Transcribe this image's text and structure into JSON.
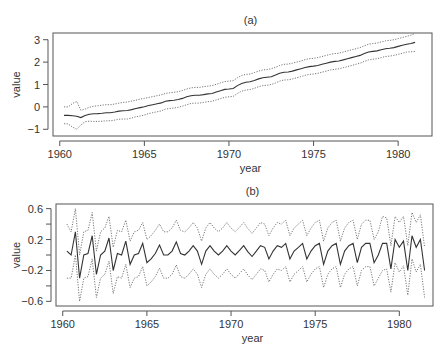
{
  "chart_data": [
    {
      "type": "line",
      "title": "(a)",
      "xlabel": "year",
      "ylabel": "value",
      "xlim": [
        1959.6,
        1982
      ],
      "ylim": [
        -1.3,
        3.3
      ],
      "xticks": [
        1960,
        1965,
        1970,
        1975,
        1980
      ],
      "yticks": [
        -1,
        0,
        1,
        2,
        3
      ],
      "grid": false,
      "legend": "none",
      "box": {
        "left": 53,
        "top": 33,
        "right": 432,
        "bottom": 136
      },
      "x_start": 1960.25,
      "x_step": 0.25,
      "series": [
        {
          "name": "estimate",
          "style": "solid",
          "values": [
            -0.38,
            -0.38,
            -0.4,
            -0.42,
            -0.48,
            -0.38,
            -0.33,
            -0.31,
            -0.3,
            -0.28,
            -0.26,
            -0.26,
            -0.23,
            -0.19,
            -0.17,
            -0.16,
            -0.12,
            -0.07,
            -0.03,
            0.01,
            0.06,
            0.1,
            0.14,
            0.18,
            0.25,
            0.28,
            0.3,
            0.33,
            0.38,
            0.45,
            0.5,
            0.52,
            0.52,
            0.55,
            0.58,
            0.6,
            0.66,
            0.72,
            0.78,
            0.8,
            0.82,
            0.95,
            1.05,
            1.1,
            1.12,
            1.18,
            1.25,
            1.3,
            1.32,
            1.35,
            1.42,
            1.5,
            1.55,
            1.56,
            1.6,
            1.65,
            1.7,
            1.76,
            1.8,
            1.82,
            1.85,
            1.9,
            1.95,
            2.0,
            2.03,
            2.05,
            2.1,
            2.15,
            2.2,
            2.25,
            2.3,
            2.38,
            2.45,
            2.48,
            2.5,
            2.55,
            2.6,
            2.62,
            2.65,
            2.7,
            2.75,
            2.8,
            2.83,
            2.88
          ]
        },
        {
          "name": "upper",
          "style": "dotted",
          "values": [
            0.0,
            0.0,
            0.15,
            0.25,
            -0.15,
            -0.1,
            -0.02,
            0.03,
            0.05,
            0.08,
            0.1,
            0.1,
            0.13,
            0.17,
            0.2,
            0.22,
            0.26,
            0.3,
            0.35,
            0.38,
            0.42,
            0.46,
            0.5,
            0.54,
            0.6,
            0.63,
            0.65,
            0.68,
            0.73,
            0.8,
            0.85,
            0.87,
            0.87,
            0.9,
            0.93,
            0.95,
            1.01,
            1.07,
            1.13,
            1.15,
            1.17,
            1.3,
            1.4,
            1.45,
            1.47,
            1.53,
            1.6,
            1.65,
            1.67,
            1.7,
            1.77,
            1.85,
            1.9,
            1.91,
            1.95,
            2.0,
            2.05,
            2.11,
            2.15,
            2.17,
            2.2,
            2.25,
            2.3,
            2.35,
            2.38,
            2.4,
            2.45,
            2.5,
            2.55,
            2.6,
            2.65,
            2.73,
            2.8,
            2.83,
            2.85,
            2.9,
            2.95,
            2.97,
            3.0,
            3.05,
            3.1,
            3.15,
            3.2,
            3.28
          ]
        },
        {
          "name": "lower",
          "style": "dotted",
          "values": [
            -0.75,
            -0.76,
            -0.9,
            -1.0,
            -0.8,
            -0.66,
            -0.64,
            -0.65,
            -0.65,
            -0.64,
            -0.62,
            -0.62,
            -0.59,
            -0.55,
            -0.54,
            -0.54,
            -0.5,
            -0.44,
            -0.41,
            -0.36,
            -0.3,
            -0.26,
            -0.22,
            -0.18,
            -0.1,
            -0.07,
            -0.05,
            -0.02,
            0.03,
            0.1,
            0.15,
            0.17,
            0.17,
            0.2,
            0.23,
            0.25,
            0.31,
            0.37,
            0.43,
            0.45,
            0.47,
            0.6,
            0.7,
            0.75,
            0.77,
            0.83,
            0.9,
            0.95,
            0.97,
            1.0,
            1.07,
            1.15,
            1.2,
            1.21,
            1.25,
            1.3,
            1.35,
            1.41,
            1.45,
            1.47,
            1.5,
            1.55,
            1.6,
            1.65,
            1.68,
            1.7,
            1.75,
            1.8,
            1.85,
            1.9,
            1.95,
            2.03,
            2.1,
            2.13,
            2.15,
            2.2,
            2.25,
            2.27,
            2.3,
            2.35,
            2.4,
            2.45,
            2.46,
            2.48
          ]
        }
      ]
    },
    {
      "type": "line",
      "title": "(b)",
      "xlabel": "year",
      "ylabel": "value",
      "xlim": [
        1959.6,
        1982
      ],
      "ylim": [
        -0.66,
        0.66
      ],
      "xticks": [
        1960,
        1965,
        1970,
        1975,
        1980
      ],
      "yticks": [
        0.6,
        0.2,
        -0.2,
        -0.6
      ],
      "yminorticks": [
        0.4,
        0.0,
        -0.4
      ],
      "grid": false,
      "legend": "none",
      "box": {
        "left": 56,
        "top": 204,
        "right": 433,
        "bottom": 306
      },
      "x_start": 1960.25,
      "x_step": 0.25,
      "series": [
        {
          "name": "estimate",
          "style": "solid",
          "values": [
            0.05,
            0.0,
            0.3,
            -0.3,
            0.0,
            0.02,
            0.25,
            -0.25,
            0.0,
            0.05,
            0.22,
            -0.2,
            0.02,
            0.0,
            0.18,
            -0.12,
            0.0,
            0.02,
            0.15,
            -0.1,
            -0.05,
            0.02,
            0.13,
            0.0,
            0.0,
            0.05,
            0.17,
            0.02,
            0.0,
            0.05,
            0.12,
            0.05,
            -0.12,
            0.05,
            0.12,
            0.05,
            0.0,
            0.05,
            0.12,
            0.05,
            0.0,
            0.06,
            0.12,
            0.04,
            -0.02,
            0.05,
            0.12,
            0.1,
            -0.05,
            0.05,
            0.12,
            0.1,
            0.15,
            -0.05,
            0.05,
            0.1,
            0.15,
            -0.05,
            0.05,
            0.12,
            0.15,
            -0.12,
            0.05,
            0.12,
            0.15,
            -0.12,
            0.05,
            0.12,
            0.15,
            -0.1,
            0.1,
            0.15,
            0.15,
            -0.1,
            0.0,
            0.15,
            0.15,
            -0.18,
            0.2,
            0.1,
            0.18,
            -0.2,
            0.25,
            0.1,
            0.2,
            -0.2
          ]
        },
        {
          "name": "upper",
          "style": "dotted",
          "values": [
            0.4,
            0.3,
            0.6,
            0.0,
            0.3,
            0.32,
            0.55,
            0.05,
            0.3,
            0.35,
            0.5,
            0.1,
            0.32,
            0.3,
            0.45,
            0.18,
            0.3,
            0.32,
            0.42,
            0.2,
            0.25,
            0.32,
            0.4,
            0.3,
            0.3,
            0.35,
            0.45,
            0.32,
            0.3,
            0.35,
            0.42,
            0.35,
            0.18,
            0.35,
            0.42,
            0.35,
            0.3,
            0.35,
            0.42,
            0.35,
            0.3,
            0.36,
            0.42,
            0.34,
            0.28,
            0.35,
            0.42,
            0.4,
            0.25,
            0.35,
            0.42,
            0.4,
            0.45,
            0.25,
            0.35,
            0.4,
            0.45,
            0.25,
            0.35,
            0.42,
            0.45,
            0.18,
            0.35,
            0.42,
            0.45,
            0.18,
            0.35,
            0.42,
            0.45,
            0.2,
            0.4,
            0.45,
            0.45,
            0.2,
            0.3,
            0.5,
            0.48,
            0.12,
            0.5,
            0.42,
            0.5,
            0.12,
            0.55,
            0.42,
            0.52,
            0.1
          ]
        },
        {
          "name": "lower",
          "style": "dotted",
          "values": [
            -0.3,
            -0.3,
            0.0,
            -0.6,
            -0.3,
            -0.28,
            -0.05,
            -0.55,
            -0.3,
            -0.25,
            -0.08,
            -0.5,
            -0.28,
            -0.3,
            -0.12,
            -0.42,
            -0.3,
            -0.28,
            -0.15,
            -0.4,
            -0.35,
            -0.28,
            -0.17,
            -0.3,
            -0.3,
            -0.25,
            -0.13,
            -0.28,
            -0.3,
            -0.25,
            -0.18,
            -0.25,
            -0.42,
            -0.25,
            -0.18,
            -0.25,
            -0.3,
            -0.25,
            -0.18,
            -0.25,
            -0.3,
            -0.24,
            -0.18,
            -0.26,
            -0.32,
            -0.25,
            -0.18,
            -0.2,
            -0.35,
            -0.25,
            -0.18,
            -0.2,
            -0.15,
            -0.35,
            -0.25,
            -0.2,
            -0.15,
            -0.35,
            -0.25,
            -0.18,
            -0.15,
            -0.42,
            -0.25,
            -0.18,
            -0.15,
            -0.42,
            -0.25,
            -0.18,
            -0.15,
            -0.4,
            -0.2,
            -0.15,
            -0.15,
            -0.4,
            -0.3,
            -0.2,
            -0.18,
            -0.48,
            -0.1,
            -0.22,
            -0.14,
            -0.52,
            -0.05,
            -0.22,
            -0.12,
            -0.55
          ]
        }
      ]
    }
  ]
}
